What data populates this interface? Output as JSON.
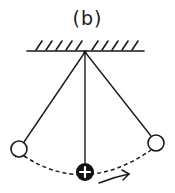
{
  "figure": {
    "label": "(b)",
    "stroke_color": "#1a1a1a",
    "background": "#ffffff"
  },
  "ceiling": {
    "y": 51,
    "x1": 27,
    "x2": 144,
    "hatch_count": 11
  },
  "pivot": {
    "x": 85,
    "y": 51
  },
  "bobs": [
    {
      "name": "left-extreme",
      "x": 19,
      "y": 149,
      "r": 8,
      "filled": false
    },
    {
      "name": "center",
      "x": 85,
      "y": 172,
      "r": 9,
      "filled": true,
      "symbol": "+"
    },
    {
      "name": "right-extreme",
      "x": 156,
      "y": 143,
      "r": 8,
      "filled": false
    }
  ],
  "motion_arrow": {
    "direction": "right"
  }
}
